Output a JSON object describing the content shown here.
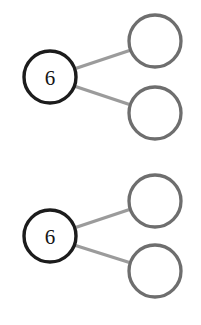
{
  "canvas": {
    "width": 201,
    "height": 325,
    "background_color": "#ffffff"
  },
  "style": {
    "source_node_stroke_color": "#1c1c1c",
    "target_node_stroke_color": "#6e6e6e",
    "edge_color": "#9b9b9b",
    "node_fill_color": "#ffffff",
    "label_color": "#151515",
    "node_stroke_width": 3.4,
    "edge_stroke_width": 3.4
  },
  "diagrams": [
    {
      "id": "diagram-top",
      "nodes": [
        {
          "id": "top-source",
          "role": "source",
          "label": "6",
          "cx": 50,
          "cy": 77,
          "r": 26,
          "outline": "dark",
          "filled": false
        },
        {
          "id": "top-target-upper",
          "role": "target",
          "label": "",
          "cx": 155,
          "cy": 41,
          "r": 26,
          "outline": "gray",
          "filled": false
        },
        {
          "id": "top-target-lower",
          "role": "target",
          "label": "",
          "cx": 155,
          "cy": 113,
          "r": 26,
          "outline": "gray",
          "filled": false
        }
      ],
      "edges": [
        {
          "id": "top-edge-upper",
          "from": "top-source",
          "to": "top-target-upper",
          "x1": 74,
          "y1": 69,
          "x2": 131,
          "y2": 50
        },
        {
          "id": "top-edge-lower",
          "from": "top-source",
          "to": "top-target-lower",
          "x1": 74,
          "y1": 86,
          "x2": 131,
          "y2": 105
        }
      ]
    },
    {
      "id": "diagram-bottom",
      "nodes": [
        {
          "id": "bottom-source",
          "role": "source",
          "label": "6",
          "cx": 50,
          "cy": 236,
          "r": 26,
          "outline": "dark",
          "filled": false
        },
        {
          "id": "bottom-target-upper",
          "role": "target",
          "label": "",
          "cx": 155,
          "cy": 201,
          "r": 26,
          "outline": "gray",
          "filled": false
        },
        {
          "id": "bottom-target-lower",
          "role": "target",
          "label": "",
          "cx": 155,
          "cy": 271,
          "r": 26,
          "outline": "gray",
          "filled": false
        }
      ],
      "edges": [
        {
          "id": "bottom-edge-upper",
          "from": "bottom-source",
          "to": "bottom-target-upper",
          "x1": 74,
          "y1": 228,
          "x2": 131,
          "y2": 209
        },
        {
          "id": "bottom-edge-lower",
          "from": "bottom-source",
          "to": "bottom-target-lower",
          "x1": 74,
          "y1": 245,
          "x2": 131,
          "y2": 263
        }
      ]
    }
  ]
}
